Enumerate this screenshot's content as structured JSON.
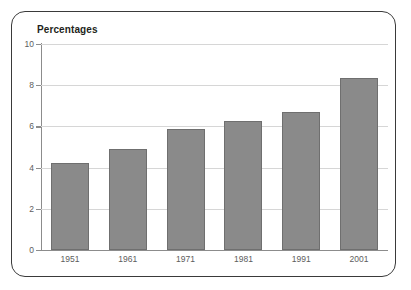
{
  "chart_data": {
    "type": "bar",
    "title": "Percentages",
    "xlabel": "",
    "ylabel": "",
    "categories": [
      "1951",
      "1961",
      "1971",
      "1981",
      "1991",
      "2001"
    ],
    "values": [
      4.2,
      4.9,
      5.85,
      6.25,
      6.7,
      8.35
    ],
    "ylim": [
      0,
      10
    ],
    "yticks": [
      0,
      2,
      4,
      6,
      8,
      10
    ],
    "ytick_labels": [
      "0",
      "2",
      "4",
      "6",
      "8",
      "10"
    ],
    "grid": "horizontal",
    "legend": "none",
    "series": [
      {
        "name": "Percentages",
        "values": [
          4.2,
          4.9,
          5.85,
          6.25,
          6.7,
          8.35
        ]
      }
    ],
    "colors": {
      "bar_fill": "#8a8a8a",
      "bar_edge": "#6f6f6f",
      "gridline": "#d6d6d6",
      "axis": "#8c8c8c",
      "tick_text": "#5d5d5d",
      "title_text": "#231f20",
      "frame_border": "#3a3a3a",
      "background": "#ffffff"
    }
  }
}
